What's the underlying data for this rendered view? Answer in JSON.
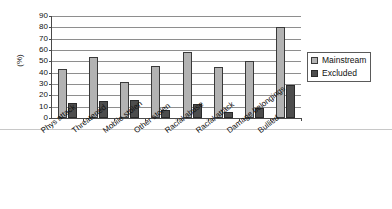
{
  "chart_data": {
    "type": "bar",
    "title": "",
    "xlabel": "",
    "ylabel": "(%)",
    "ylim": [
      0,
      90
    ],
    "ytick_step": 10,
    "grid": true,
    "legend_position": "right",
    "categories": [
      "Phys attack",
      "Threatened",
      "Mobile stolen",
      "Other stolen",
      "Racial abuse",
      "Racial attack",
      "Damage belongings",
      "Bullied"
    ],
    "ytick_labels": [
      "90",
      "80",
      "70",
      "60",
      "50",
      "40",
      "30",
      "20",
      "10",
      "0"
    ],
    "series": [
      {
        "name": "Mainstream",
        "color": "#b3b3b3",
        "values": [
          43,
          54,
          32,
          46,
          58,
          45,
          50,
          80
        ]
      },
      {
        "name": "Excluded",
        "color": "#4d4d4d",
        "values": [
          13,
          15,
          16,
          7,
          12,
          5,
          9,
          29
        ]
      }
    ]
  },
  "legend": {
    "items": [
      {
        "label": "Mainstream"
      },
      {
        "label": "Excluded"
      }
    ]
  }
}
